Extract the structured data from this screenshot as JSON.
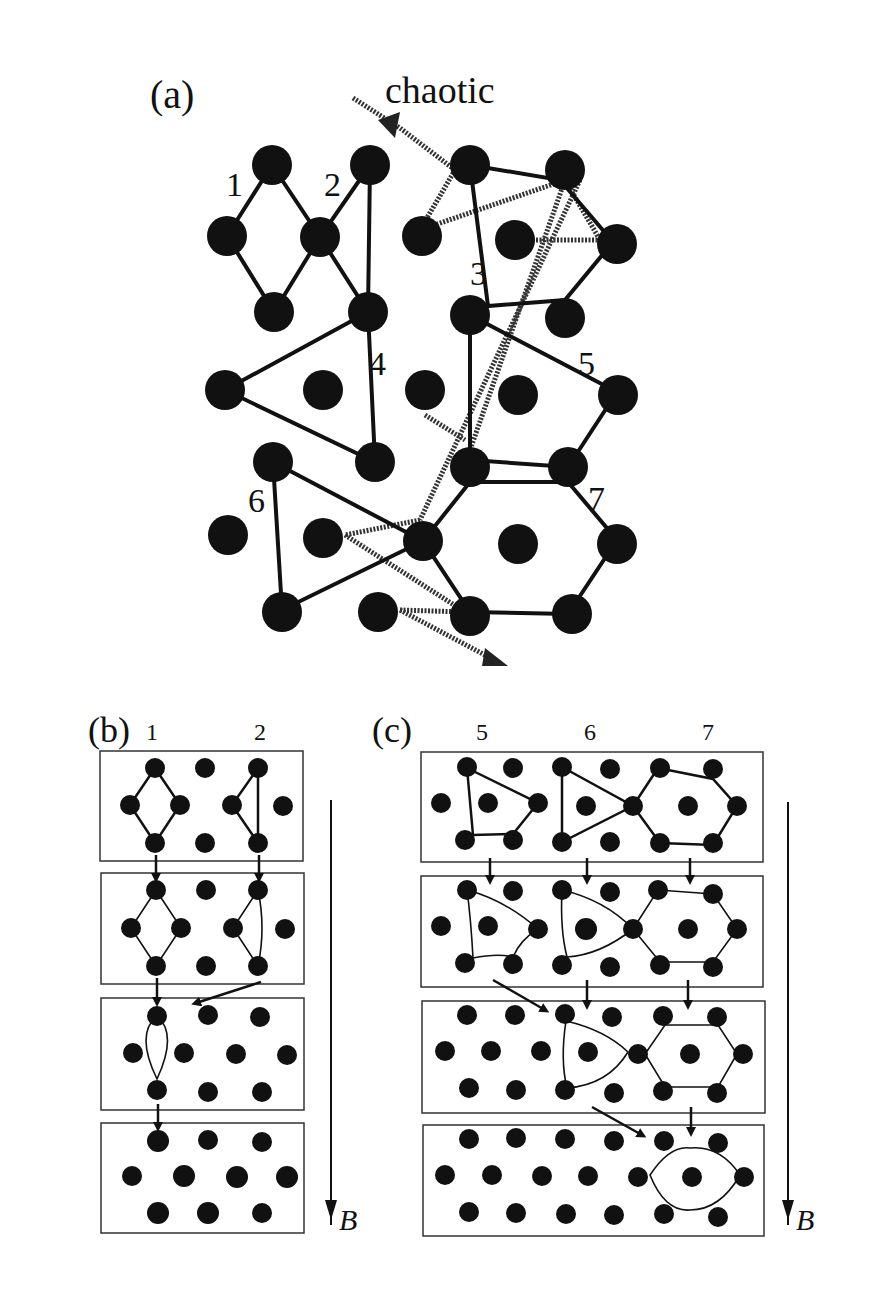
{
  "figure": {
    "panel_a": {
      "label": "(a)",
      "annotation": "chaotic",
      "cluster_labels": [
        "1",
        "2",
        "3",
        "4",
        "5",
        "6",
        "7"
      ]
    },
    "panel_b": {
      "label": "(b)",
      "column_labels": [
        "1",
        "2"
      ],
      "field_label": "B",
      "frames": 4
    },
    "panel_c": {
      "label": "(c)",
      "column_labels": [
        "5",
        "6",
        "7"
      ],
      "field_label": "B",
      "frames": 4
    },
    "colors": {
      "ink": "#111111",
      "background": "#ffffff"
    }
  }
}
